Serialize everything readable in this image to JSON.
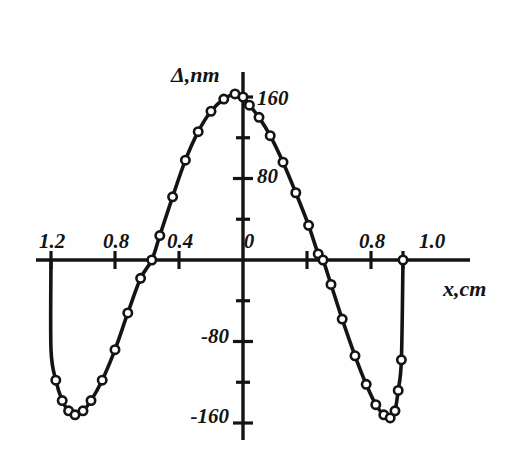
{
  "chart_data": {
    "type": "line",
    "title": "",
    "xlabel": "x,cm",
    "ylabel": "Δ,nm",
    "grid": false,
    "legend": null,
    "xlim": [
      -1.25,
      1.1
    ],
    "ylim": [
      -185,
      185
    ],
    "x_tick_labels": [
      "1.2",
      "0.8",
      "0.4",
      "0",
      "0.8",
      "1.0"
    ],
    "y_tick_labels": [
      "160",
      "80",
      "-80",
      "-160"
    ],
    "y_ticks_all": [
      160,
      120,
      80,
      40,
      0,
      -40,
      -80,
      -120,
      -160
    ],
    "y_ticks_labeled": [
      160,
      80,
      -80,
      -160
    ],
    "x_ticks_all": [
      -1.2,
      -0.8,
      -0.4,
      0,
      0.4,
      0.8,
      1.0
    ],
    "marker": "open-circle",
    "series": [
      {
        "name": "Δ(x)",
        "points": [
          [
            -1.2,
            0
          ],
          [
            -1.2,
            -88
          ],
          [
            -1.17,
            -118
          ],
          [
            -1.13,
            -138
          ],
          [
            -1.09,
            -148
          ],
          [
            -1.05,
            -152
          ],
          [
            -1.0,
            -148
          ],
          [
            -0.95,
            -138
          ],
          [
            -0.88,
            -118
          ],
          [
            -0.8,
            -88
          ],
          [
            -0.72,
            -52
          ],
          [
            -0.64,
            -18
          ],
          [
            -0.57,
            0
          ],
          [
            -0.52,
            24
          ],
          [
            -0.44,
            62
          ],
          [
            -0.36,
            98
          ],
          [
            -0.28,
            126
          ],
          [
            -0.2,
            146
          ],
          [
            -0.12,
            158
          ],
          [
            -0.05,
            163
          ],
          [
            0.0,
            160
          ],
          [
            0.04,
            152
          ],
          [
            0.1,
            140
          ],
          [
            0.17,
            122
          ],
          [
            0.25,
            96
          ],
          [
            0.33,
            66
          ],
          [
            0.41,
            34
          ],
          [
            0.47,
            6
          ],
          [
            0.5,
            0
          ],
          [
            0.55,
            -24
          ],
          [
            0.62,
            -58
          ],
          [
            0.7,
            -94
          ],
          [
            0.77,
            -122
          ],
          [
            0.83,
            -142
          ],
          [
            0.88,
            -152
          ],
          [
            0.92,
            -155
          ],
          [
            0.95,
            -148
          ],
          [
            0.97,
            -128
          ],
          [
            0.99,
            -98
          ],
          [
            1.0,
            0
          ]
        ]
      }
    ],
    "annotations": []
  },
  "axis": {
    "y_title": "Δ,nm",
    "x_title": "x,cm"
  },
  "x_labels": [
    {
      "text": "1.2",
      "px": 52
    },
    {
      "text": "0.8",
      "px": 116
    },
    {
      "text": "0.4",
      "px": 180
    },
    {
      "text": "0",
      "px": 249
    },
    {
      "text": "0.8",
      "px": 372
    },
    {
      "text": "1.0",
      "px": 432
    }
  ],
  "y_labels": [
    {
      "text": "160",
      "py": 97
    },
    {
      "text": "80",
      "py": 175
    },
    {
      "text": "-80",
      "py": 335
    },
    {
      "text": "-160",
      "py": 415
    }
  ]
}
